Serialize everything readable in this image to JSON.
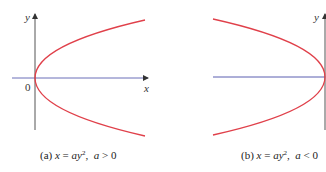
{
  "figures": [
    {
      "id": "a",
      "caption_prefix": "(a)",
      "equation_lhs": "x",
      "equation_eq": " = ",
      "equation_rhs": "ay",
      "exponent": "2",
      "condition_var": "a",
      "condition_op": " > ",
      "condition_val": "0",
      "axis_x_label": "x",
      "axis_y_label": "y",
      "origin_label": "0",
      "opens": "right"
    },
    {
      "id": "b",
      "caption_prefix": "(b)",
      "equation_lhs": "x",
      "equation_eq": " = ",
      "equation_rhs": "ay",
      "exponent": "2",
      "condition_var": "a",
      "condition_op": " < ",
      "condition_val": "0",
      "axis_y_label": "y",
      "opens": "left"
    }
  ],
  "colors": {
    "curve": "#e0404a",
    "axis": "#555555",
    "x_axis_tint": "#5a5fb0"
  }
}
